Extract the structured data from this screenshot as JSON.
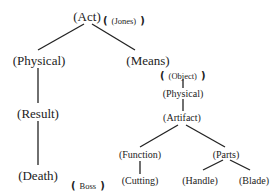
{
  "diagram": {
    "type": "tree",
    "nodes": {
      "act": "(Act)",
      "physical_left": "(Physical)",
      "means": "(Means)",
      "result": "(Result)",
      "death": "(Death)",
      "object": "(Object)",
      "physical_right": "(Physical)",
      "artifact": "(Artifact)",
      "function": "(Function)",
      "parts": "(Parts)",
      "cutting": "(Cutting)",
      "handle": "(Handle)",
      "blade": "(Blade)"
    },
    "annotations": {
      "jones": "(Jones)",
      "boss": "Boss",
      "open_bracket": "(",
      "close_bracket": ")"
    },
    "edges": [
      [
        "act",
        "physical_left"
      ],
      [
        "act",
        "means"
      ],
      [
        "physical_left",
        "result"
      ],
      [
        "result",
        "death"
      ],
      [
        "means",
        "object"
      ],
      [
        "object",
        "physical_right"
      ],
      [
        "physical_right",
        "artifact"
      ],
      [
        "artifact",
        "function"
      ],
      [
        "artifact",
        "parts"
      ],
      [
        "function",
        "cutting"
      ],
      [
        "parts",
        "handle"
      ],
      [
        "parts",
        "blade"
      ]
    ]
  }
}
